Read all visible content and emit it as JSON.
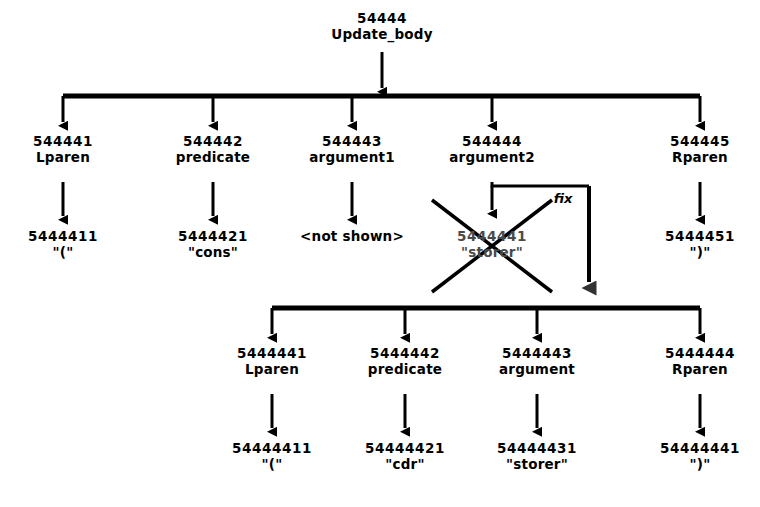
{
  "diagram": {
    "title_node": {
      "code": "54444",
      "label": "Update_body"
    },
    "upper_level2": [
      {
        "code": "544441",
        "label": "Lparen"
      },
      {
        "code": "544442",
        "label": "predicate"
      },
      {
        "code": "544443",
        "label": "argument1"
      },
      {
        "code": "544444",
        "label": "argument2"
      },
      {
        "code": "544445",
        "label": "Rparen"
      }
    ],
    "upper_level3": [
      {
        "code": "5444411",
        "label": "\"(\""
      },
      {
        "code": "5444421",
        "label": "\"cons\""
      },
      {
        "code": "",
        "label": "<not shown>"
      },
      {
        "code": "5444441",
        "label": "\"storer\"",
        "struck": true
      },
      {
        "code": "5444451",
        "label": "\")\""
      }
    ],
    "fix_label": "fix",
    "lower_level1": [
      {
        "code": "5444441",
        "label": "Lparen"
      },
      {
        "code": "5444442",
        "label": "predicate"
      },
      {
        "code": "5444443",
        "label": "argument"
      },
      {
        "code": "5444444",
        "label": "Rparen"
      }
    ],
    "lower_level2": [
      {
        "code": "54444411",
        "label": "\"(\""
      },
      {
        "code": "54444421",
        "label": "\"cdr\""
      },
      {
        "code": "54444431",
        "label": "\"storer\""
      },
      {
        "code": "54444441",
        "label": "\")\""
      }
    ],
    "colors": {
      "ink": "#000000",
      "background": "#ffffff",
      "struck_ink": "#4a4a4a"
    }
  }
}
